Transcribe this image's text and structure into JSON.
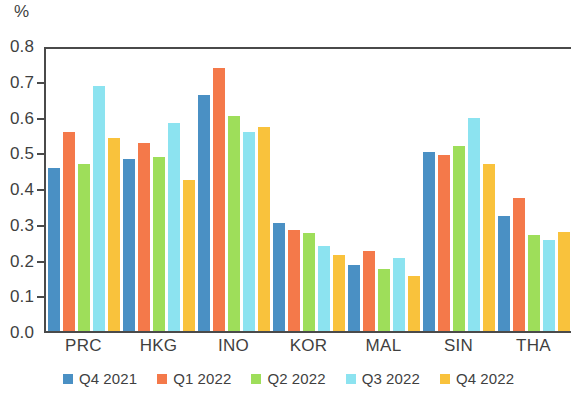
{
  "chart_data": {
    "type": "bar",
    "title": "",
    "subtitle": "",
    "xlabel": "",
    "ylabel": "%",
    "unit_label": "%",
    "ylim": [
      0.0,
      0.8
    ],
    "ytick_labels": [
      "0.8",
      "0.7",
      "0.6",
      "0.5",
      "0.4",
      "0.3",
      "0.2",
      "0.1",
      "0.0"
    ],
    "yticks": [
      0.8,
      0.7,
      0.6,
      0.5,
      0.4,
      0.3,
      0.2,
      0.1,
      0.0
    ],
    "grid": false,
    "legend_position": "bottom",
    "categories": [
      "PRC",
      "HKG",
      "INO",
      "KOR",
      "MAL",
      "SIN",
      "THA"
    ],
    "series": [
      {
        "name": "Q4 2021",
        "color": "#4a90c4",
        "values": [
          0.46,
          0.485,
          0.665,
          0.305,
          0.185,
          0.505,
          0.325
        ]
      },
      {
        "name": "Q1 2022",
        "color": "#f4794a",
        "values": [
          0.56,
          0.53,
          0.74,
          0.285,
          0.225,
          0.495,
          0.375
        ]
      },
      {
        "name": "Q2 2022",
        "color": "#9ede5a",
        "values": [
          0.47,
          0.49,
          0.605,
          0.275,
          0.175,
          0.52,
          0.27
        ]
      },
      {
        "name": "Q3 2022",
        "color": "#8ce3f0",
        "values": [
          0.69,
          0.585,
          0.56,
          0.24,
          0.205,
          0.6,
          0.255
        ]
      },
      {
        "name": "Q4 2022",
        "color": "#f9c23c",
        "values": [
          0.545,
          0.425,
          0.575,
          0.215,
          0.155,
          0.47,
          0.28
        ]
      }
    ]
  }
}
